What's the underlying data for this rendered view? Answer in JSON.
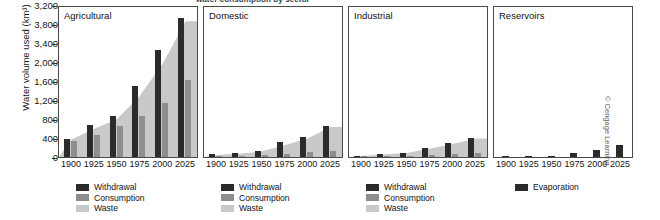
{
  "figure": {
    "cropped_caption": "water consumption by sector",
    "credit": "© Cengage Learning"
  },
  "axis": {
    "ylabel": "Water volume used (km³)",
    "yticks": [
      "3,200",
      "3,800",
      "3,400",
      "2,000",
      "1,600",
      "1,200",
      "800",
      "400",
      "0"
    ],
    "xticks": [
      "1900",
      "1925",
      "1950",
      "1975",
      "2000",
      "2025"
    ]
  },
  "legend": {
    "withdrawal": "Withdrawal",
    "consumption": "Consumption",
    "waste": "Waste",
    "evaporation": "Evaporation"
  },
  "colors": {
    "withdrawal": "#2b2b2b",
    "consumption": "#8e8e8e",
    "waste": "#c9c9c9",
    "evaporation": "#2b2b2b",
    "axis": "#4a4a4a"
  },
  "panels": [
    {
      "title": "Agricultural"
    },
    {
      "title": "Domestic"
    },
    {
      "title": "Industrial"
    },
    {
      "title": "Reservoirs"
    }
  ],
  "chart_data": {
    "type": "bar",
    "xlabel": "",
    "ylabel": "Water volume used (km³)",
    "x": [
      1900,
      1925,
      1950,
      1975,
      2000,
      2025
    ],
    "ylim": [
      0,
      4200
    ],
    "ytick_values": [
      4200,
      3800,
      3400,
      2000,
      1600,
      1200,
      800,
      400,
      0
    ],
    "ytick_labels": [
      "3,200",
      "3,800",
      "3,400",
      "2,000",
      "1,600",
      "1,200",
      "800",
      "400",
      "0"
    ],
    "grid": false,
    "legend_position": "below-panel",
    "panels": [
      {
        "name": "Agricultural",
        "series": [
          {
            "name": "Withdrawal",
            "values": [
              500,
              900,
              1150,
              2000,
              3000,
              3900
            ]
          },
          {
            "name": "Consumption",
            "values": [
              440,
              620,
              860,
              1150,
              1500,
              2150
            ]
          },
          {
            "name": "Waste",
            "values": [
              480,
              780,
              1050,
              1700,
              2600,
              3800
            ]
          }
        ]
      },
      {
        "name": "Domestic",
        "series": [
          {
            "name": "Withdrawal",
            "values": [
              80,
              100,
              170,
              420,
              560,
              880
            ]
          },
          {
            "name": "Consumption",
            "values": [
              25,
              35,
              55,
              90,
              130,
              170
            ]
          },
          {
            "name": "Waste",
            "values": [
              60,
              90,
              150,
              330,
              520,
              840
            ]
          }
        ]
      },
      {
        "name": "Industrial",
        "series": [
          {
            "name": "Withdrawal",
            "values": [
              30,
              90,
              120,
              260,
              390,
              530
            ]
          },
          {
            "name": "Consumption",
            "values": [
              10,
              20,
              30,
              50,
              80,
              110
            ]
          },
          {
            "name": "Waste",
            "values": [
              25,
              70,
              110,
              230,
              360,
              520
            ]
          }
        ]
      },
      {
        "name": "Reservoirs",
        "series": [
          {
            "name": "Evaporation",
            "values": [
              30,
              25,
              40,
              110,
              210,
              330
            ]
          }
        ]
      }
    ]
  }
}
